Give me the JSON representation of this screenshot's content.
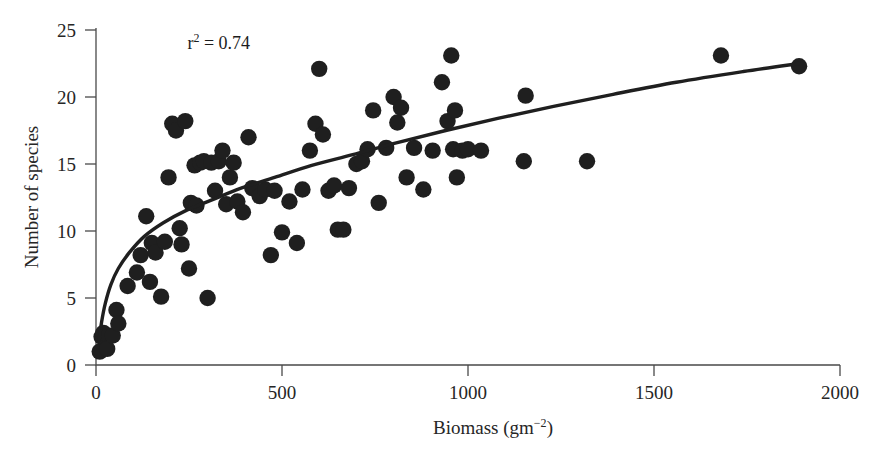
{
  "chart_data": {
    "type": "scatter",
    "title": "",
    "xlabel": "Biomass (gm−2)",
    "ylabel": "Number of species",
    "xlim": [
      0,
      2000
    ],
    "ylim": [
      0,
      25
    ],
    "xticks": [
      0,
      500,
      1000,
      1500,
      2000
    ],
    "yticks": [
      0,
      5,
      10,
      15,
      20,
      25
    ],
    "xtick_labels": [
      "0",
      "500",
      "1000",
      "1500",
      "2000"
    ],
    "ytick_labels": [
      "0",
      "5",
      "10",
      "15",
      "20",
      "25"
    ],
    "grid": false,
    "legend": null,
    "annotations": [
      {
        "text": "r² = 0.74",
        "x": 330,
        "y": 23.6,
        "name": "r-squared-annotation"
      }
    ],
    "series": [
      {
        "name": "Plant survey plots",
        "marker": "filled-circle",
        "color": "#1f1f1f",
        "points": [
          [
            10,
            1.0
          ],
          [
            15,
            2.1
          ],
          [
            20,
            2.4
          ],
          [
            30,
            1.2
          ],
          [
            45,
            2.2
          ],
          [
            55,
            4.1
          ],
          [
            60,
            3.1
          ],
          [
            85,
            5.9
          ],
          [
            110,
            6.9
          ],
          [
            120,
            8.2
          ],
          [
            135,
            11.1
          ],
          [
            145,
            6.2
          ],
          [
            150,
            9.1
          ],
          [
            160,
            8.4
          ],
          [
            175,
            5.1
          ],
          [
            185,
            9.2
          ],
          [
            195,
            14.0
          ],
          [
            205,
            18.0
          ],
          [
            215,
            17.5
          ],
          [
            225,
            10.2
          ],
          [
            230,
            9.0
          ],
          [
            240,
            18.2
          ],
          [
            250,
            7.2
          ],
          [
            255,
            12.1
          ],
          [
            265,
            14.9
          ],
          [
            270,
            11.9
          ],
          [
            280,
            15.1
          ],
          [
            290,
            15.2
          ],
          [
            300,
            5.0
          ],
          [
            310,
            15.1
          ],
          [
            320,
            13.0
          ],
          [
            330,
            15.2
          ],
          [
            340,
            16.0
          ],
          [
            350,
            12.0
          ],
          [
            360,
            14.0
          ],
          [
            370,
            15.1
          ],
          [
            380,
            12.2
          ],
          [
            395,
            11.4
          ],
          [
            410,
            17.0
          ],
          [
            420,
            13.2
          ],
          [
            440,
            12.6
          ],
          [
            455,
            13.1
          ],
          [
            470,
            8.2
          ],
          [
            480,
            13.0
          ],
          [
            500,
            9.9
          ],
          [
            520,
            12.2
          ],
          [
            540,
            9.1
          ],
          [
            555,
            13.1
          ],
          [
            575,
            16.0
          ],
          [
            590,
            18.0
          ],
          [
            600,
            22.1
          ],
          [
            610,
            17.2
          ],
          [
            625,
            13.0
          ],
          [
            640,
            13.4
          ],
          [
            650,
            10.1
          ],
          [
            665,
            10.1
          ],
          [
            680,
            13.2
          ],
          [
            700,
            15.0
          ],
          [
            715,
            15.2
          ],
          [
            730,
            16.1
          ],
          [
            745,
            19.0
          ],
          [
            760,
            12.1
          ],
          [
            780,
            16.2
          ],
          [
            800,
            20.0
          ],
          [
            810,
            18.1
          ],
          [
            820,
            19.2
          ],
          [
            835,
            14.0
          ],
          [
            855,
            16.2
          ],
          [
            880,
            13.1
          ],
          [
            905,
            16.0
          ],
          [
            930,
            21.1
          ],
          [
            945,
            18.2
          ],
          [
            955,
            23.1
          ],
          [
            960,
            16.1
          ],
          [
            965,
            19.0
          ],
          [
            970,
            14.0
          ],
          [
            985,
            16.0
          ],
          [
            1000,
            16.1
          ],
          [
            1035,
            16.0
          ],
          [
            1155,
            20.1
          ],
          [
            1150,
            15.2
          ],
          [
            1320,
            15.2
          ],
          [
            1680,
            23.1
          ],
          [
            1890,
            22.3
          ]
        ]
      }
    ],
    "fit_curve": {
      "name": "logarithmic-fit",
      "color": "#1f1f1f",
      "points": [
        [
          8,
          1.8
        ],
        [
          15,
          3.2
        ],
        [
          25,
          4.6
        ],
        [
          40,
          6.0
        ],
        [
          60,
          7.2
        ],
        [
          90,
          8.4
        ],
        [
          130,
          9.6
        ],
        [
          180,
          10.6
        ],
        [
          240,
          11.5
        ],
        [
          310,
          12.3
        ],
        [
          390,
          13.2
        ],
        [
          480,
          14.0
        ],
        [
          580,
          14.9
        ],
        [
          690,
          15.7
        ],
        [
          810,
          16.6
        ],
        [
          940,
          17.5
        ],
        [
          1080,
          18.4
        ],
        [
          1230,
          19.3
        ],
        [
          1390,
          20.2
        ],
        [
          1560,
          21.1
        ],
        [
          1740,
          21.9
        ],
        [
          1890,
          22.5
        ]
      ]
    }
  },
  "figure": {
    "background_color": "#ffffff",
    "ink_color": "#1f1f1f",
    "axis_color": "#4a4a4a"
  }
}
